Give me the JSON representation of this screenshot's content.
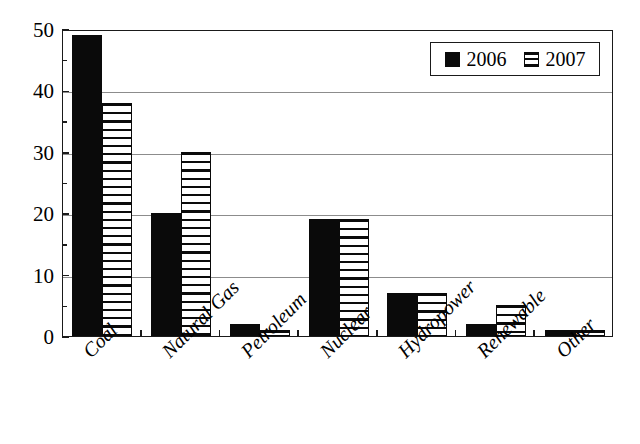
{
  "chart_data": {
    "type": "bar",
    "title": "",
    "subtitle": "",
    "xlabel": "",
    "ylabel": "",
    "ylim": [
      0,
      50
    ],
    "ytick_labels": [
      "0",
      "10",
      "20",
      "30",
      "40",
      "50"
    ],
    "ytick_values": [
      0,
      10,
      20,
      30,
      40,
      50
    ],
    "yminor_values": [
      5,
      15,
      25,
      35,
      45
    ],
    "grid": "horizontal-major-only",
    "legend_position": "upper-right",
    "categories": [
      "Coal",
      "Natural Gas",
      "Petroleum",
      "Nuclear",
      "Hydropower",
      "Renewable",
      "Other"
    ],
    "series": [
      {
        "name": "2006",
        "fill": "solid-black",
        "color": "#0a0a0a",
        "values": [
          49,
          20,
          2,
          19,
          7,
          2,
          1
        ]
      },
      {
        "name": "2007",
        "fill": "horizontal-hatch",
        "color": "#0a0a0a",
        "values": [
          38,
          30,
          1,
          19,
          7,
          5,
          1
        ]
      }
    ],
    "annotations": []
  },
  "legend": {
    "items": [
      {
        "label": "2006",
        "swatch": "solid-swatch"
      },
      {
        "label": "2007",
        "swatch": "hatched-swatch"
      }
    ]
  },
  "axis": {
    "y_labels": [
      "50",
      "40",
      "30",
      "20",
      "10",
      "0"
    ],
    "x_labels": [
      "Coal",
      "Natural Gas",
      "Petroleum",
      "Nuclear",
      "Hydropower",
      "Renewable",
      "Other"
    ]
  },
  "style": {
    "plot_border_color": "#1a1a1a",
    "gridline_color": "#8c8c8c",
    "background": "#ffffff",
    "ink": "#0a0a0a"
  }
}
